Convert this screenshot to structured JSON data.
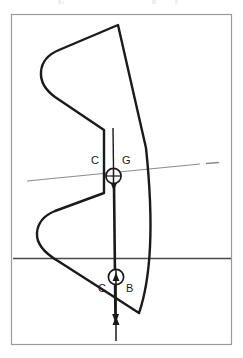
{
  "figure": {
    "name": "ship-stability-cross-section",
    "background_color": "#ffffff",
    "ink_color": "#1a1a1a",
    "rule_color": "#8c8c8c",
    "frame": {
      "name": "figure-border",
      "stroke": "#9a9a9a",
      "x": 11,
      "y": 14,
      "width": 221,
      "height": 331
    },
    "clipped_caption_remnant": "",
    "labels": {
      "cg_left": "C",
      "cg_right": "G",
      "cb_left": "C",
      "cb_right": "B"
    },
    "markers": [
      {
        "name": "centre-of-gravity-marker",
        "label_left": "C",
        "label_right": "G",
        "symbol": "circle-with-crosshair",
        "cx": 113,
        "cy": 176,
        "r": 8
      },
      {
        "name": "centre-of-buoyancy-marker",
        "label_left": "C",
        "label_right": "B",
        "symbol": "circle-with-crosshair",
        "cx": 116,
        "cy": 277,
        "r": 8
      }
    ],
    "lines": {
      "inclined_waterline": {
        "name": "inclined-waterline",
        "x1": 27,
        "y1": 181,
        "x2": 200,
        "y2": 164,
        "stroke": "#8c8c8c"
      },
      "inclined_waterline_dash": {
        "name": "inclined-waterline-dash",
        "x1": 206,
        "y1": 163,
        "x2": 219,
        "y2": 162,
        "stroke": "#8c8c8c"
      },
      "upright_waterline": {
        "name": "upright-waterline",
        "x1": 13,
        "y1": 258,
        "x2": 231,
        "y2": 258,
        "stroke": "#4a4a4a"
      },
      "weight_vector": {
        "name": "weight-force-vector",
        "x1": 113,
        "y1": 130,
        "x2": 115,
        "y2": 323,
        "stroke": "#1a1a1a"
      },
      "buoyancy_vector": {
        "name": "buoyancy-force-vector",
        "x1": 116,
        "y1": 340,
        "x2": 116,
        "y2": 277,
        "stroke": "#1a1a1a"
      }
    },
    "hull_outline": {
      "name": "hull-section-outline",
      "stroke": "#1a1a1a",
      "stroke_width": 2.4,
      "path": "M 118 25 L 146 148 Q 152 205 150 247 Q 148 286 139 313 L 108 293 L 58 261 Q 36 248 37 233 Q 38 219 54 212 L 104 193 L 104 130 L 55 96 Q 40 85 41 72 Q 42 58 58 50 Z"
    }
  }
}
